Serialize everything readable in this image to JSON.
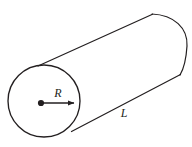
{
  "figure": {
    "name": "cylinder-with-radius-and-length",
    "type": "geometry-diagram",
    "background_color": "#ffffff",
    "stroke_color": "#231f20",
    "stroke_width": 1.2,
    "labels": {
      "radius": "R",
      "length": "L"
    },
    "geometry": {
      "near_circle": {
        "center_x": 44,
        "center_y": 101,
        "radius": 36
      },
      "center_dot": {
        "x": 41,
        "y": 103,
        "radius": 3
      },
      "radius_arrow": {
        "from_x": 41,
        "from_y": 103,
        "to_x": 76,
        "to_y": 103
      },
      "top_edge": {
        "x1": 38,
        "y1": 66,
        "x2": 152,
        "y2": 14
      },
      "bottom_edge": {
        "x1": 72,
        "y1": 131,
        "x2": 180,
        "y2": 75
      },
      "far_cap_arc": {
        "start_x": 152,
        "start_y": 14,
        "end_x": 180,
        "end_y": 75,
        "rightmost_x": 187,
        "rightmost_y": 45
      }
    },
    "label_positions": {
      "radius_label": {
        "x": 58,
        "y": 97
      },
      "length_label": {
        "x": 124,
        "y": 117
      }
    }
  }
}
